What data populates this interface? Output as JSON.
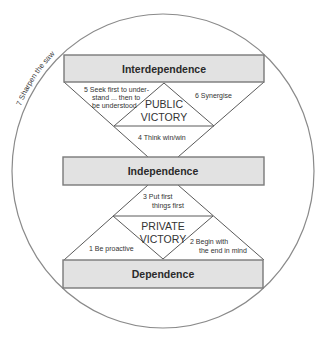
{
  "diagram": {
    "outer_circle_label": "7  Sharpen the saw",
    "levels": {
      "top": "Interdependence",
      "middle": "Independence",
      "bottom": "Dependence"
    },
    "victories": {
      "public": [
        "PUBLIC",
        "VICTORY"
      ],
      "private": [
        "PRIVATE",
        "VICTORY"
      ]
    },
    "habits": {
      "h1": "1   Be proactive",
      "h2": [
        "2   Begin with",
        "the end in mind"
      ],
      "h3": [
        "3   Put first",
        "things first"
      ],
      "h4": "4   Think win/win",
      "h5": [
        "5   Seek first to under-",
        "stand ... then to",
        "be understood"
      ],
      "h6": "6   Synergise"
    },
    "colors": {
      "box_fill": "#e2e2e2",
      "box_border": "#7a7a7a",
      "line": "#5a5a5a",
      "text": "#2a2a2a"
    }
  }
}
